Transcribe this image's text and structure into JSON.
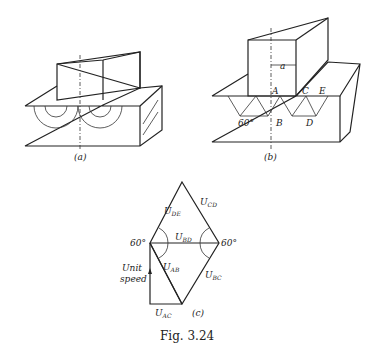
{
  "figure": {
    "caption": "Fig. 3.24",
    "panel_a": {
      "label": "(a)"
    },
    "panel_b": {
      "label": "(b)",
      "points": [
        "A",
        "B",
        "C",
        "D",
        "E"
      ],
      "dimension": "a",
      "angle": "60°"
    },
    "panel_c": {
      "label": "(c)",
      "vectors": {
        "de": "U",
        "cd": "U",
        "bd": "U",
        "ab": "U",
        "bc": "U",
        "ac": "U"
      },
      "subs": {
        "de": "DE",
        "cd": "CD",
        "bd": "BD",
        "ab": "AB",
        "bc": "BC",
        "ac": "AC"
      },
      "angle_left": "60°",
      "angle_right": "60°",
      "unit_line1": "Unit",
      "unit_line2": "speed"
    }
  }
}
